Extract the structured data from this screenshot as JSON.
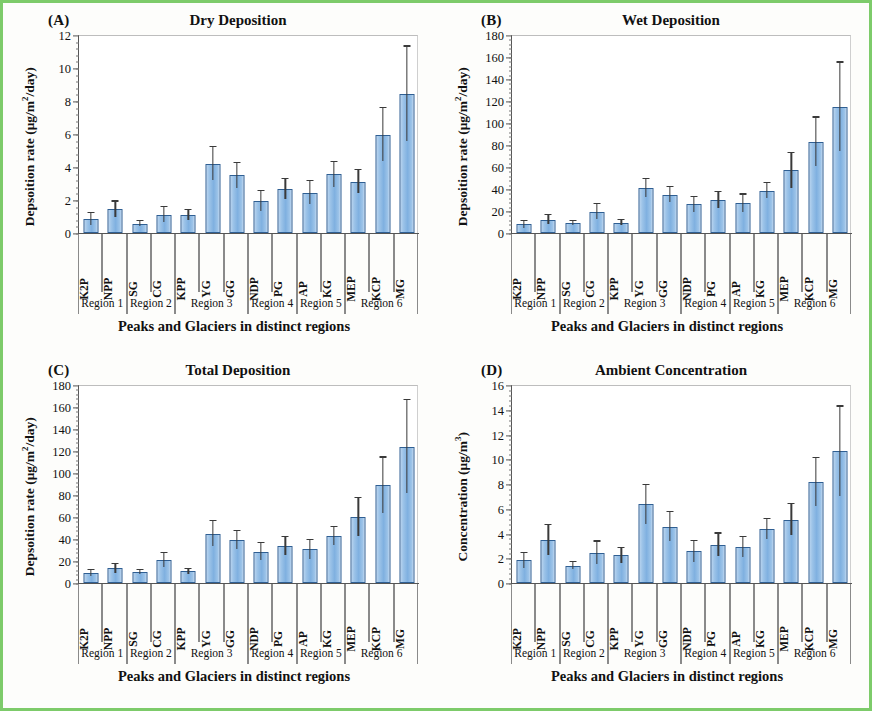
{
  "figure": {
    "border_color": "#7dcb6a",
    "bar_color": "#8FB6E0",
    "bar_edge_color": "#2F5F93",
    "error_bar_color": "#3A3A3A"
  },
  "shared": {
    "xlabel": "Peaks and Glaciers in distinct regions",
    "categories": [
      "K2P",
      "NPP",
      "SG",
      "CG",
      "KPP",
      "YG",
      "GG",
      "NDP",
      "PG",
      "AP",
      "KG",
      "MEP",
      "KCP",
      "MG"
    ],
    "regions": [
      {
        "label": "Region 1",
        "count": 2
      },
      {
        "label": "Region 2",
        "count": 2
      },
      {
        "label": "Region 3",
        "count": 3
      },
      {
        "label": "Region 4",
        "count": 2
      },
      {
        "label": "Region 5",
        "count": 2
      },
      {
        "label": "Region 6",
        "count": 3
      }
    ]
  },
  "panels": [
    {
      "id": "a",
      "letter": "(A)",
      "title": "Dry Deposition",
      "ylabel": "Depsoition rate (μg/m²/day)",
      "ylabel_html": "Depsoition rate (μg/m<sup>2</sup>/day)"
    },
    {
      "id": "b",
      "letter": "(B)",
      "title": "Wet Deposition",
      "ylabel": "Depsoition rate (μg/m²/day)",
      "ylabel_html": "Depsoition rate (μg/m<sup>2</sup>/day)"
    },
    {
      "id": "c",
      "letter": "(C)",
      "title": "Total Deposition",
      "ylabel": "Depsoition rate (μg/m²/day)",
      "ylabel_html": "Depsoition rate (μg/m<sup>2</sup>/day)"
    },
    {
      "id": "d",
      "letter": "(D)",
      "title": "Ambient Concentration",
      "ylabel": "Concentration (μg/m³)",
      "ylabel_html": "Concentration (μg/m<sup>3</sup>)"
    }
  ],
  "chart_data": [
    {
      "type": "bar",
      "panel": "A",
      "title": "Dry Deposition",
      "xlabel": "Peaks and Glaciers in distinct regions",
      "ylabel": "Depsoition rate (μg/m²/day)",
      "ylim": [
        0,
        12
      ],
      "ytick_step": 2,
      "yticks": [
        0,
        2,
        4,
        6,
        8,
        10,
        12
      ],
      "grid": false,
      "legend": "none",
      "categories": [
        "K2P",
        "NPP",
        "SG",
        "CG",
        "KPP",
        "YG",
        "GG",
        "NDP",
        "PG",
        "AP",
        "KG",
        "MEP",
        "KCP",
        "MG"
      ],
      "values": [
        0.85,
        1.45,
        0.55,
        1.1,
        1.1,
        4.2,
        3.5,
        1.95,
        2.65,
        2.45,
        3.55,
        3.1,
        5.95,
        8.45
      ],
      "err_upper": [
        0.35,
        0.45,
        0.15,
        0.45,
        0.3,
        1.0,
        0.75,
        0.6,
        0.6,
        0.7,
        0.75,
        0.7,
        1.6,
        2.85
      ],
      "err_lower": [
        0.35,
        0.45,
        0.15,
        0.45,
        0.3,
        1.0,
        0.75,
        0.6,
        0.6,
        0.7,
        0.75,
        0.7,
        1.6,
        2.85
      ]
    },
    {
      "type": "bar",
      "panel": "B",
      "title": "Wet Deposition",
      "xlabel": "Peaks and Glaciers in distinct regions",
      "ylabel": "Depsoition rate (μg/m²/day)",
      "ylim": [
        0,
        180
      ],
      "ytick_step": 20,
      "yticks": [
        0,
        20,
        40,
        60,
        80,
        100,
        120,
        140,
        160,
        180
      ],
      "grid": false,
      "legend": "none",
      "categories": [
        "K2P",
        "NPP",
        "SG",
        "CG",
        "KPP",
        "YG",
        "GG",
        "NDP",
        "PG",
        "AP",
        "KG",
        "MEP",
        "KCP",
        "MG"
      ],
      "values": [
        8,
        12,
        9,
        19.5,
        9.5,
        41,
        35,
        26,
        30,
        27,
        38.5,
        57,
        83,
        115
      ],
      "err_upper": [
        3,
        4,
        2,
        6.5,
        2,
        8,
        7,
        7,
        7.5,
        8,
        7,
        16,
        22,
        40
      ],
      "err_lower": [
        3,
        4,
        2,
        6.5,
        2,
        8,
        7,
        7,
        7.5,
        8,
        7,
        16,
        22,
        40
      ]
    },
    {
      "type": "bar",
      "panel": "C",
      "title": "Total Deposition",
      "xlabel": "Peaks and Glaciers in distinct regions",
      "ylabel": "Depsoition rate (μg/m²/day)",
      "ylim": [
        0,
        180
      ],
      "ytick_step": 20,
      "yticks": [
        0,
        20,
        40,
        60,
        80,
        100,
        120,
        140,
        160,
        180
      ],
      "grid": false,
      "legend": "none",
      "categories": [
        "K2P",
        "NPP",
        "SG",
        "CG",
        "KPP",
        "YG",
        "GG",
        "NDP",
        "PG",
        "AP",
        "KG",
        "MEP",
        "KCP",
        "MG"
      ],
      "values": [
        9,
        13.5,
        10,
        21,
        10.5,
        45,
        39,
        28.5,
        33.5,
        30.5,
        42.5,
        60,
        89,
        124
      ],
      "err_upper": [
        3,
        4,
        2,
        6,
        2,
        11,
        8,
        7.5,
        8,
        8.5,
        8,
        17,
        25,
        42
      ],
      "err_lower": [
        3,
        4,
        2,
        6,
        2,
        11,
        8,
        7.5,
        8,
        8.5,
        8,
        17,
        25,
        42
      ]
    },
    {
      "type": "bar",
      "panel": "D",
      "title": "Ambient Concentration",
      "xlabel": "Peaks and Glaciers in distinct regions",
      "ylabel": "Concentration (μg/m³)",
      "ylim": [
        0,
        16
      ],
      "ytick_step": 2,
      "yticks": [
        0,
        2,
        4,
        6,
        8,
        10,
        12,
        14,
        16
      ],
      "grid": false,
      "legend": "none",
      "categories": [
        "K2P",
        "NPP",
        "SG",
        "CG",
        "KPP",
        "YG",
        "GG",
        "NDP",
        "PG",
        "AP",
        "KG",
        "MEP",
        "KCP",
        "MG"
      ],
      "values": [
        1.85,
        3.45,
        1.4,
        2.45,
        2.25,
        6.35,
        4.55,
        2.55,
        3.1,
        2.9,
        4.35,
        5.1,
        8.15,
        10.65
      ],
      "err_upper": [
        0.6,
        1.2,
        0.3,
        0.9,
        0.6,
        1.55,
        1.15,
        0.85,
        0.9,
        0.8,
        0.8,
        1.25,
        1.95,
        3.6
      ],
      "err_lower": [
        0.6,
        1.2,
        0.3,
        0.9,
        0.6,
        1.55,
        1.15,
        0.85,
        0.9,
        0.8,
        0.8,
        1.25,
        1.95,
        3.6
      ]
    }
  ]
}
